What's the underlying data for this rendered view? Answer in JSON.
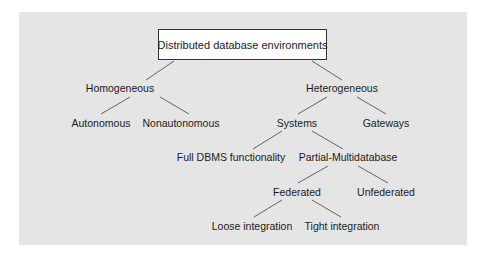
{
  "diagram": {
    "type": "tree",
    "panel_color": "#e5e5e5",
    "line_color": "#555555",
    "root": {
      "label": "Distributed database environments"
    },
    "nodes": {
      "homogeneous": {
        "label": "Homogeneous",
        "x": 120,
        "y": 88
      },
      "heterogeneous": {
        "label": "Heterogeneous",
        "x": 342,
        "y": 88
      },
      "autonomous": {
        "label": "Autonomous",
        "x": 101,
        "y": 123
      },
      "nonautonomous": {
        "label": "Nonautonomous",
        "x": 181,
        "y": 123
      },
      "systems": {
        "label": "Systems",
        "x": 297,
        "y": 123
      },
      "gateways": {
        "label": "Gateways",
        "x": 386,
        "y": 123
      },
      "full_dbms": {
        "label": "Full DBMS functionality",
        "x": 231,
        "y": 157
      },
      "partial_multidatabase": {
        "label": "Partial-Multidatabase",
        "x": 348,
        "y": 157
      },
      "federated": {
        "label": "Federated",
        "x": 297,
        "y": 192
      },
      "unfederated": {
        "label": "Unfederated",
        "x": 386,
        "y": 192
      },
      "loose_integration": {
        "label": "Loose integration",
        "x": 252,
        "y": 226
      },
      "tight_integration": {
        "label": "Tight integration",
        "x": 342,
        "y": 226
      }
    },
    "edges": [
      [
        "root",
        "homogeneous"
      ],
      [
        "root",
        "heterogeneous"
      ],
      [
        "homogeneous",
        "autonomous"
      ],
      [
        "homogeneous",
        "nonautonomous"
      ],
      [
        "heterogeneous",
        "systems"
      ],
      [
        "heterogeneous",
        "gateways"
      ],
      [
        "systems",
        "full_dbms"
      ],
      [
        "systems",
        "partial_multidatabase"
      ],
      [
        "partial_multidatabase",
        "federated"
      ],
      [
        "partial_multidatabase",
        "unfederated"
      ],
      [
        "federated",
        "loose_integration"
      ],
      [
        "federated",
        "tight_integration"
      ]
    ]
  }
}
